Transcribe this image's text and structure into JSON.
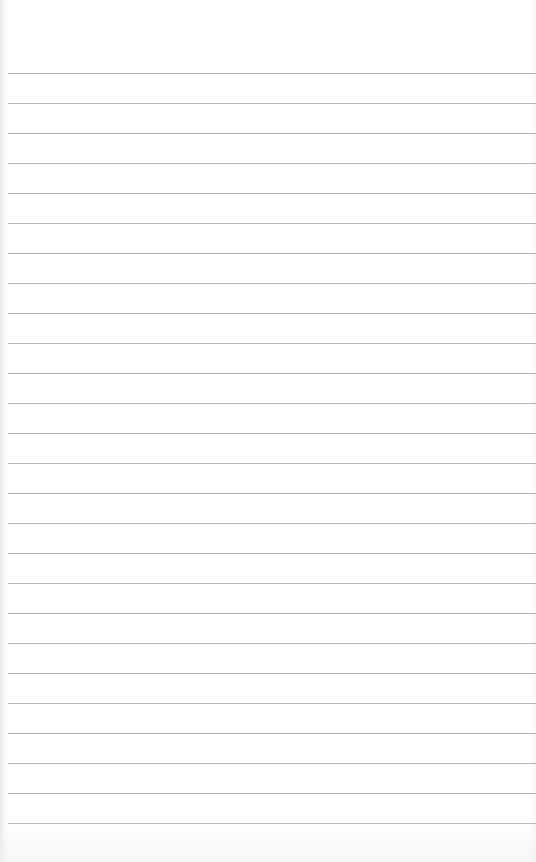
{
  "page": {
    "type": "ruled-notepad-sheet",
    "background_color": "#ffffff",
    "rule_color": "#a9a9a9",
    "rule_count": 26,
    "first_rule_y": 73,
    "rule_spacing": 30,
    "text_content": ""
  }
}
